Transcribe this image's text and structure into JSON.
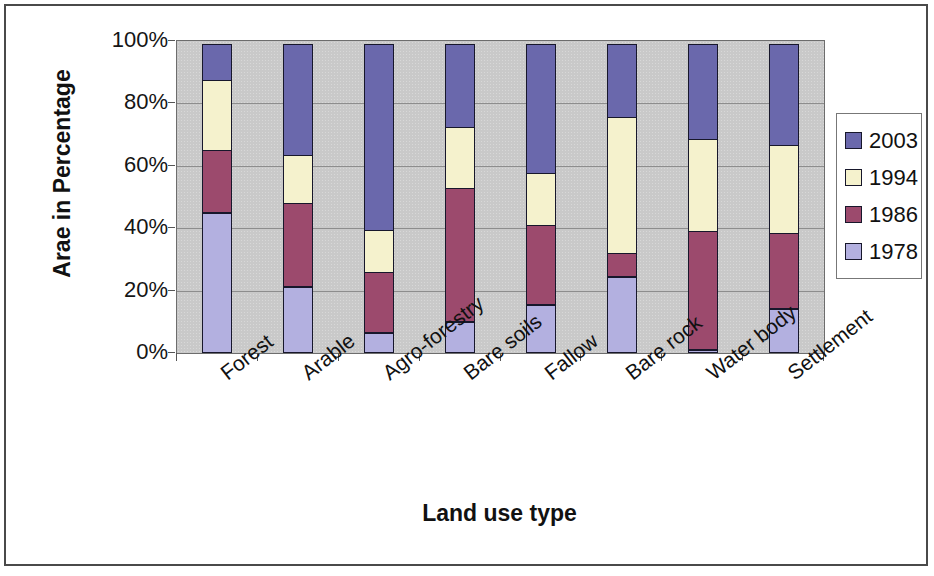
{
  "chart_data": {
    "type": "bar",
    "subtype": "100% stacked column",
    "title": "",
    "xlabel": "Land use type",
    "ylabel": "Arae in Percentage",
    "ylim": [
      0,
      100
    ],
    "ytick_labels": [
      "0%",
      "20%",
      "40%",
      "60%",
      "80%",
      "100%"
    ],
    "ytick_values": [
      0,
      20,
      40,
      60,
      80,
      100
    ],
    "grid": true,
    "grid_axis": "y",
    "legend_position": "right",
    "plot_background": "#c9c9c9",
    "categories": [
      "Forest",
      "Arable",
      "Agro-forestry",
      "Bare soils",
      "Fallow",
      "Bare rock",
      "Water body",
      "Settlement"
    ],
    "series": [
      {
        "name": "1978",
        "color": "#b3b0e0",
        "values": [
          45,
          21,
          6.5,
          10,
          15.5,
          24.5,
          1,
          14
        ]
      },
      {
        "name": "1986",
        "color": "#9c4a6d",
        "values": [
          20,
          27,
          19.5,
          43,
          25.5,
          7.5,
          38,
          24.5
        ]
      },
      {
        "name": "1994",
        "color": "#f5f2cd",
        "values": [
          23,
          16,
          14,
          20,
          17,
          44,
          30,
          28.5
        ]
      },
      {
        "name": "2003",
        "color": "#6a68ac",
        "values": [
          12,
          36,
          60,
          27,
          42,
          24,
          31,
          33
        ]
      }
    ],
    "cumulative_tops": {
      "Forest": [
        45,
        65,
        88,
        100
      ],
      "Arable": [
        21,
        48,
        64,
        100
      ],
      "Agro-forestry": [
        6.5,
        26,
        40,
        100
      ],
      "Bare soils": [
        10,
        53,
        73,
        100
      ],
      "Fallow": [
        15.5,
        41,
        58,
        100
      ],
      "Bare rock": [
        24.5,
        32,
        76,
        100
      ],
      "Water body": [
        1,
        39,
        69,
        100
      ],
      "Settlement": [
        14,
        38.5,
        67,
        100
      ]
    }
  },
  "legend": {
    "entries": [
      {
        "label": "2003",
        "color": "#6a68ac"
      },
      {
        "label": "1994",
        "color": "#f5f2cd"
      },
      {
        "label": "1986",
        "color": "#9c4a6d"
      },
      {
        "label": "1978",
        "color": "#b3b0e0"
      }
    ]
  }
}
